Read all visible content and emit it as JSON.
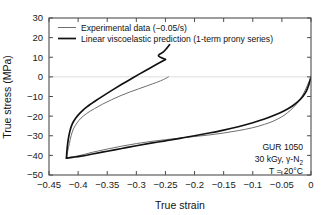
{
  "chart_data": {
    "type": "line",
    "title": "",
    "xlabel": "True strain",
    "ylabel": "True stress (MPa)",
    "xlim": [
      -0.45,
      0.0
    ],
    "ylim": [
      -50,
      30
    ],
    "xticks": [
      "−0.45",
      "−0.4",
      "−0.35",
      "−0.3",
      "−0.25",
      "−0.2",
      "−0.15",
      "−0.1",
      "−0.05",
      "0"
    ],
    "xtick_values": [
      -0.45,
      -0.4,
      -0.35,
      -0.3,
      -0.25,
      -0.2,
      -0.15,
      -0.1,
      -0.05,
      0
    ],
    "yticks": [
      "30",
      "20",
      "10",
      "0",
      "−10",
      "−20",
      "−30",
      "−40",
      "−50"
    ],
    "ytick_values": [
      30,
      20,
      10,
      0,
      -10,
      -20,
      -30,
      -40,
      -50
    ],
    "grid": false,
    "zero_line": true,
    "legend_position": "upper-left",
    "series": [
      {
        "name": "Experimental data (−0.05/s)",
        "color": "#6e6e6e",
        "width": 1.0,
        "loading": [
          [
            0.0,
            0.0
          ],
          [
            -0.005,
            -3.5
          ],
          [
            -0.012,
            -8.0
          ],
          [
            -0.02,
            -12.0
          ],
          [
            -0.03,
            -15.5
          ],
          [
            -0.04,
            -18.2
          ],
          [
            -0.05,
            -20.3
          ],
          [
            -0.065,
            -22.6
          ],
          [
            -0.08,
            -24.2
          ],
          [
            -0.1,
            -25.9
          ],
          [
            -0.125,
            -27.4
          ],
          [
            -0.15,
            -28.6
          ],
          [
            -0.175,
            -29.6
          ],
          [
            -0.2,
            -30.4
          ],
          [
            -0.225,
            -31.2
          ],
          [
            -0.25,
            -32.0
          ],
          [
            -0.275,
            -32.9
          ],
          [
            -0.3,
            -34.0
          ],
          [
            -0.325,
            -35.3
          ],
          [
            -0.35,
            -36.8
          ],
          [
            -0.375,
            -38.4
          ],
          [
            -0.395,
            -39.9
          ],
          [
            -0.41,
            -40.8
          ],
          [
            -0.42,
            -41.3
          ]
        ],
        "unloading": [
          [
            -0.42,
            -41.3
          ],
          [
            -0.418,
            -38.0
          ],
          [
            -0.415,
            -34.0
          ],
          [
            -0.412,
            -30.0
          ],
          [
            -0.408,
            -26.5
          ],
          [
            -0.402,
            -23.5
          ],
          [
            -0.395,
            -21.0
          ],
          [
            -0.385,
            -18.6
          ],
          [
            -0.372,
            -16.2
          ],
          [
            -0.358,
            -13.9
          ],
          [
            -0.343,
            -11.7
          ],
          [
            -0.328,
            -9.7
          ],
          [
            -0.312,
            -7.8
          ],
          [
            -0.296,
            -6.1
          ],
          [
            -0.28,
            -4.4
          ],
          [
            -0.265,
            -2.8
          ],
          [
            -0.253,
            -1.3
          ],
          [
            -0.245,
            0.0
          ]
        ]
      },
      {
        "name": "Linear viscoelastic prediction (1-term prony series)",
        "color": "#111111",
        "width": 1.7,
        "loading": [
          [
            0.0,
            0.0
          ],
          [
            -0.004,
            -4.2
          ],
          [
            -0.008,
            -7.3
          ],
          [
            -0.014,
            -10.0
          ],
          [
            -0.022,
            -12.5
          ],
          [
            -0.032,
            -14.8
          ],
          [
            -0.045,
            -17.1
          ],
          [
            -0.06,
            -19.2
          ],
          [
            -0.08,
            -21.5
          ],
          [
            -0.1,
            -23.4
          ],
          [
            -0.125,
            -25.4
          ],
          [
            -0.15,
            -27.1
          ],
          [
            -0.175,
            -28.6
          ],
          [
            -0.2,
            -30.0
          ],
          [
            -0.225,
            -31.3
          ],
          [
            -0.25,
            -32.6
          ],
          [
            -0.275,
            -33.8
          ],
          [
            -0.3,
            -35.1
          ],
          [
            -0.325,
            -36.5
          ],
          [
            -0.35,
            -37.9
          ],
          [
            -0.375,
            -39.3
          ],
          [
            -0.395,
            -40.4
          ],
          [
            -0.41,
            -41.0
          ],
          [
            -0.42,
            -41.4
          ]
        ],
        "unloading": [
          [
            -0.42,
            -41.4
          ],
          [
            -0.419,
            -37.0
          ],
          [
            -0.417,
            -32.0
          ],
          [
            -0.414,
            -27.5
          ],
          [
            -0.41,
            -24.0
          ],
          [
            -0.404,
            -21.0
          ],
          [
            -0.396,
            -18.2
          ],
          [
            -0.385,
            -15.3
          ],
          [
            -0.37,
            -12.2
          ],
          [
            -0.355,
            -9.3
          ],
          [
            -0.34,
            -6.5
          ],
          [
            -0.325,
            -3.8
          ],
          [
            -0.31,
            -1.2
          ],
          [
            -0.295,
            1.4
          ],
          [
            -0.28,
            3.9
          ],
          [
            -0.265,
            6.4
          ],
          [
            -0.25,
            8.9
          ]
        ],
        "unloading_tail": [
          [
            -0.25,
            8.9
          ],
          [
            -0.262,
            10.8
          ],
          [
            -0.254,
            12.6
          ],
          [
            -0.248,
            14.5
          ],
          [
            -0.243,
            16.4
          ]
        ]
      }
    ],
    "annotations": [
      {
        "text": "GUR 1050"
      },
      {
        "text": "30 kGy, ",
        "sym": "γ-N",
        "sub": "2"
      },
      {
        "text": "T = 20°C"
      }
    ]
  },
  "legend": {
    "items": [
      {
        "label": "Experimental data (−0.05/s)"
      },
      {
        "label": "Linear viscoelastic prediction (1-term prony series)"
      }
    ]
  },
  "annotation": {
    "line1": "GUR 1050",
    "line2_prefix": "30 kGy, ",
    "line2_symbol": "γ-N",
    "line2_sub": "2",
    "line3": "T = 20°C"
  },
  "axes": {
    "xlabel": "True strain",
    "ylabel": "True stress (MPa)"
  }
}
